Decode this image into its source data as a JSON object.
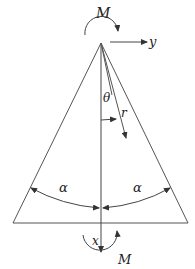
{
  "diagram": {
    "type": "wedge-with-moments",
    "colors": {
      "stroke": "#555555",
      "text": "#222222",
      "background": "#ffffff"
    },
    "labels": {
      "moment_top": "M",
      "moment_bottom": "M",
      "axis_y": "y",
      "axis_x": "x",
      "theta": "θ",
      "radius": "r",
      "alpha_left": "α",
      "alpha_right": "α"
    }
  }
}
